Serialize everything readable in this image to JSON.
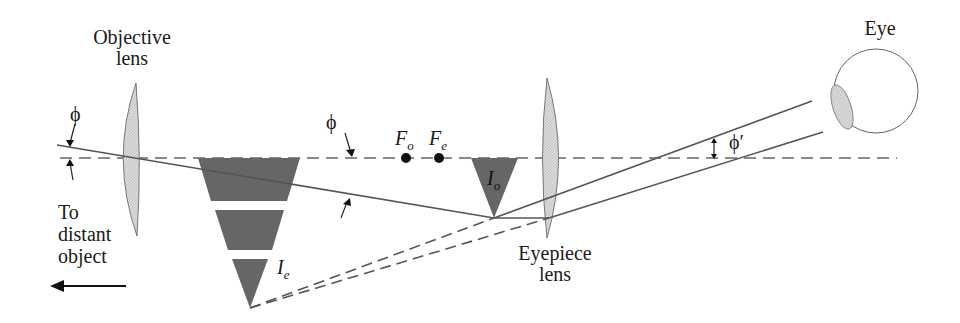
{
  "diagram": {
    "labels": {
      "objective_line1": "Objective",
      "objective_line2": "lens",
      "eyepiece_line1": "Eyepiece",
      "eyepiece_line2": "lens",
      "eye": "Eye",
      "distant_line1": "To",
      "distant_line2": "distant",
      "distant_line3": "object",
      "phi": "ϕ",
      "phi_prime": "ϕ′",
      "focal_objective_main": "F",
      "focal_objective_sub": "o",
      "focal_eyepiece_main": "F",
      "focal_eyepiece_sub": "e",
      "image_objective_main": "I",
      "image_objective_sub": "o",
      "image_eyepiece_main": "I",
      "image_eyepiece_sub": "e"
    },
    "colors": {
      "line": "#555555",
      "image_fill": "#6a6a6a",
      "lens_fill": "#d6d6d6",
      "text": "#1a1a1a"
    }
  }
}
